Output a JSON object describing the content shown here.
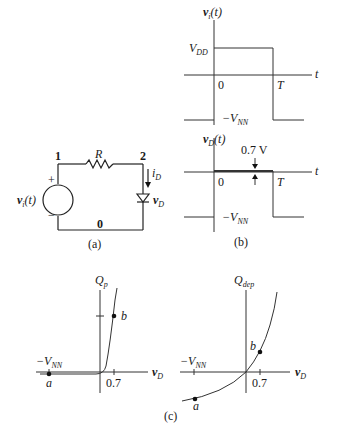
{
  "circuit": {
    "caption": "(a)",
    "node_1": "1",
    "node_2": "2",
    "node_0": "0",
    "resistor": "R",
    "source": {
      "symbol": "v",
      "subscript": "i",
      "arg": "(t)",
      "plus": "+",
      "minus": "−"
    },
    "current": {
      "symbol": "i",
      "subscript": "D"
    },
    "diode_voltage": {
      "symbol": "v",
      "subscript": "D"
    }
  },
  "waveforms": {
    "caption": "(b)",
    "vi": {
      "ylabel": {
        "symbol": "v",
        "subscript": "i",
        "arg": "(t)"
      },
      "high_label": {
        "symbol": "V",
        "subscript": "DD"
      },
      "low_label": {
        "prefix": "−V",
        "subscript": "NN"
      },
      "origin": "0",
      "period": "T",
      "xlabel": "t"
    },
    "vd": {
      "ylabel": {
        "symbol": "v",
        "subscript": "D",
        "arg": "(t)"
      },
      "forward_label": "0.7 V",
      "low_label": {
        "prefix": "−V",
        "subscript": "NN"
      },
      "origin": "0",
      "period": "T",
      "xlabel": "t"
    }
  },
  "charge_plots": {
    "caption": "(c)",
    "qp": {
      "ylabel": {
        "symbol": "Q",
        "subscript": "p"
      },
      "xlabel": {
        "symbol": "v",
        "subscript": "D"
      },
      "neg_label": {
        "prefix": "−V",
        "subscript": "NN"
      },
      "tick": "0.7",
      "point_a": "a",
      "point_b": "b"
    },
    "qdep": {
      "ylabel": {
        "symbol": "Q",
        "subscript": "dep"
      },
      "xlabel": {
        "symbol": "v",
        "subscript": "D"
      },
      "neg_label": {
        "prefix": "−V",
        "subscript": "NN"
      },
      "tick": "0.7",
      "point_a": "a",
      "point_b": "b"
    }
  }
}
